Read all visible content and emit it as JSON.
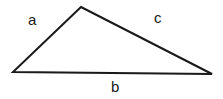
{
  "figure": {
    "name": "triangle-with-labeled-sides",
    "background_color": "#ffffff",
    "stroke_color": "#1a1a1a",
    "text_color": "#1a1a1a",
    "stroke_width": 2,
    "width": 223,
    "height": 99
  },
  "labels": {
    "side_a": "a",
    "side_b": "b",
    "side_c": "c"
  },
  "chart_data": {
    "type": "diagram",
    "shape": "triangle",
    "title": "",
    "vertices": [
      {
        "name": "apex",
        "x": 81,
        "y": 7
      },
      {
        "name": "bottom-left",
        "x": 13,
        "y": 72
      },
      {
        "name": "bottom-right",
        "x": 212,
        "y": 74
      }
    ],
    "edges": [
      {
        "label": "a",
        "from": "bottom-left",
        "to": "apex"
      },
      {
        "label": "b",
        "from": "bottom-left",
        "to": "bottom-right"
      },
      {
        "label": "c",
        "from": "apex",
        "to": "bottom-right"
      }
    ],
    "label_positions": [
      {
        "label": "a",
        "x": 33,
        "y": 20
      },
      {
        "label": "c",
        "x": 159,
        "y": 18
      },
      {
        "label": "b",
        "x": 116,
        "y": 87
      }
    ]
  }
}
